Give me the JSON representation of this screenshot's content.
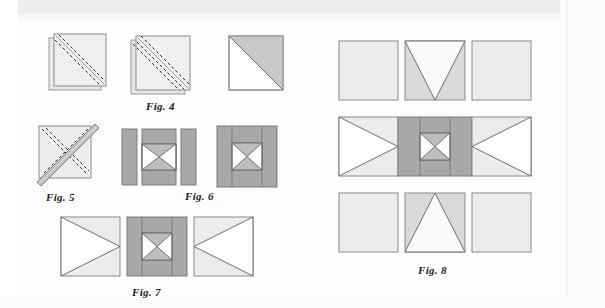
{
  "page": {
    "kind": "quilting-instruction-diagram-scan",
    "background_color": "#fdfdfd",
    "width": 605,
    "height": 308
  },
  "palette": {
    "outline": "#8a8a8a",
    "outline_dark": "#5e5e5e",
    "white_fabric": "#ffffff",
    "near_white_fabric": "#fafafa",
    "light_fabric": "#ececec",
    "light_fabric_2": "#e2e2e2",
    "medium_fabric": "#c9c9c9",
    "dark_fabric": "#a8a8a8",
    "stitch_dash": "#2b2b2b",
    "fold_edge": "#9a9a9a"
  },
  "figures": [
    {
      "id": "fig4",
      "label": "Fig. 4",
      "caption_position": "below-center",
      "description": "Two squares layered right sides together with two dashed stitching lines on either side of the drawn diagonal, then the resulting pressed half-square-triangle unit.",
      "steps": [
        {
          "name": "layered-squares-marked",
          "shape": "stacked-squares",
          "stitch_lines": 2,
          "fill": "#ececec"
        },
        {
          "name": "layered-squares-stitched",
          "shape": "stacked-squares-offset",
          "stitch_lines": 2,
          "fill": "#ececec"
        },
        {
          "name": "half-square-triangle-unit",
          "shape": "half-square-triangle",
          "upper_right_fill": "#c9c9c9",
          "lower_left_fill": "#ffffff"
        }
      ]
    },
    {
      "id": "fig5",
      "label": "Fig. 5",
      "caption_position": "below-center",
      "description": "Half-square-triangle units layered and marked with dashed lines across both diagonals, with a pressed seam band on the rising diagonal.",
      "steps": [
        {
          "name": "layered-triangle-units-marked",
          "shape": "square-with-crossed-diagonals",
          "dashed_diagonals": 2,
          "seam_band": "rising-diagonal",
          "fill": "#ececec"
        }
      ]
    },
    {
      "id": "fig6",
      "label": "Fig. 6",
      "caption_position": "below-center",
      "description": "Hourglass centre unit joined between dark sashing strips, shown exploded then assembled.",
      "steps": [
        {
          "name": "exploded-sashing-and-centre",
          "parts": [
            {
              "name": "left-sashing-strip",
              "fill": "#a8a8a8"
            },
            {
              "name": "centre-column",
              "fill": "#a8a8a8",
              "centre_unit": "hourglass"
            },
            {
              "name": "right-sashing-strip",
              "fill": "#a8a8a8"
            }
          ]
        },
        {
          "name": "assembled-sashed-centre-block",
          "shape": "square",
          "border_fill": "#a8a8a8",
          "centre_unit": "hourglass"
        }
      ]
    },
    {
      "id": "fig7",
      "label": "Fig. 7",
      "caption_position": "below-center",
      "description": "Middle row of the block: flying-geese side unit, sashed hourglass centre block, mirrored flying-geese side unit.",
      "steps": [
        {
          "name": "left-side-triangle-unit",
          "shape": "square-with-right-pointing-triangle",
          "background_fill": "#ececec",
          "triangle_fill": "#ffffff"
        },
        {
          "name": "centre-sashed-hourglass-block",
          "shape": "square",
          "border_fill": "#a8a8a8",
          "centre_unit": "hourglass"
        },
        {
          "name": "right-side-triangle-unit",
          "shape": "square-with-left-pointing-triangle",
          "background_fill": "#ececec",
          "triangle_fill": "#ffffff"
        }
      ]
    },
    {
      "id": "fig8",
      "label": "Fig. 8",
      "caption_position": "below-center",
      "description": "Complete nine-patch style block laid out in three rows: top row with a downward-pointing triangle unit, middle row from Fig. 7, bottom row with an upward-pointing triangle unit.",
      "rows": [
        {
          "name": "top-row",
          "cells": [
            {
              "name": "plain-square-left",
              "fill": "#ececec"
            },
            {
              "name": "down-pointing-triangle-unit",
              "background_fill": "#d9d9d9",
              "triangle_fill": "#fafafa",
              "direction": "down"
            },
            {
              "name": "plain-square-right",
              "fill": "#ececec"
            }
          ]
        },
        {
          "name": "middle-row",
          "cells": [
            {
              "name": "left-side-triangle-unit",
              "background_fill": "#ececec",
              "triangle_fill": "#ffffff",
              "direction": "right"
            },
            {
              "name": "centre-sashed-hourglass-block",
              "border_fill": "#a8a8a8",
              "centre_unit": "hourglass"
            },
            {
              "name": "right-side-triangle-unit",
              "background_fill": "#ececec",
              "triangle_fill": "#ffffff",
              "direction": "left"
            }
          ]
        },
        {
          "name": "bottom-row",
          "cells": [
            {
              "name": "plain-square-left",
              "fill": "#ececec"
            },
            {
              "name": "up-pointing-triangle-unit",
              "background_fill": "#d9d9d9",
              "triangle_fill": "#fafafa",
              "direction": "up"
            },
            {
              "name": "plain-square-right",
              "fill": "#ececec"
            }
          ]
        }
      ]
    }
  ]
}
